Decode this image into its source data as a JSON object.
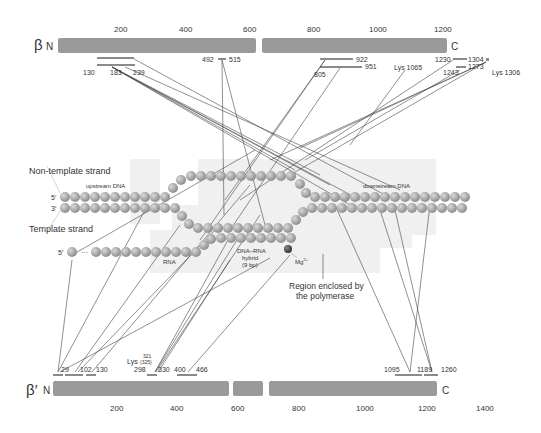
{
  "beta": {
    "symbol": "β",
    "n_label": "N",
    "c_label": "C",
    "ticks": [
      "200",
      "400",
      "600",
      "800",
      "1000",
      "1200"
    ],
    "regions": {
      "r130": "130",
      "r183": "183",
      "r239": "239",
      "r492": "492",
      "r515": "515",
      "r805": "805",
      "r922": "922",
      "r951": "951",
      "lys1065": "Lys 1065",
      "r1230": "1230",
      "r1304": "1304",
      "r1243": "1243",
      "r1273": "1273",
      "lys1306": "Lys 1306"
    }
  },
  "beta_prime": {
    "symbol": "β′",
    "n_label": "N",
    "c_label": "C",
    "ticks": [
      "200",
      "400",
      "600",
      "800",
      "1000",
      "1200",
      "1400"
    ],
    "regions": {
      "r29": "29",
      "r102": "102",
      "r130": "130",
      "lys": "Lys",
      "lys321": "321",
      "lys325": "(325)",
      "r298": "298",
      "r330": "330",
      "r400": "400",
      "r466": "466",
      "r1095": "1095",
      "r1189": "1189",
      "r1260": "1260"
    }
  },
  "labels": {
    "non_template": "Non-template strand",
    "template": "Template strand",
    "upstream": "upstream DNA",
    "downstream": "downstream DNA",
    "five_prime": "5′",
    "three_prime": "3′",
    "rna": "RNA",
    "hybrid1": "DNA–RNA",
    "hybrid2": "hybrid",
    "hybrid3": "(9 bp)",
    "mg": "Mg",
    "mg_sup": "2+",
    "region1": "Region enclosed by",
    "region2": "the polymerase",
    "ellipsis": "···"
  },
  "colors": {
    "bar": "#9a9a9a",
    "bead": "#a8a8a8",
    "bead_dark": "#555555",
    "shade": "#efefef",
    "line": "#444444"
  }
}
